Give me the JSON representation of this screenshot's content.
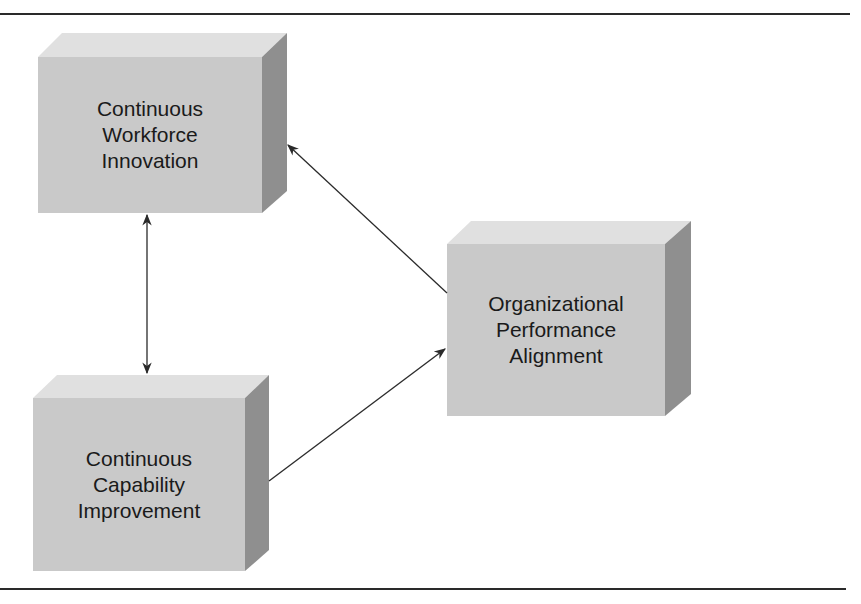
{
  "diagram": {
    "nodes": [
      {
        "id": "workforce-innovation",
        "lines": [
          "Continuous",
          "Workforce",
          "Innovation"
        ]
      },
      {
        "id": "capability-improvement",
        "lines": [
          "Continuous",
          "Capability",
          "Improvement"
        ]
      },
      {
        "id": "performance-alignment",
        "lines": [
          "Organizational",
          "Performance",
          "Alignment"
        ]
      }
    ],
    "edges": [
      {
        "from": "workforce-innovation",
        "to": "capability-improvement",
        "direction": "both"
      },
      {
        "from": "performance-alignment",
        "to": "workforce-innovation",
        "direction": "forward"
      },
      {
        "from": "capability-improvement",
        "to": "performance-alignment",
        "direction": "forward"
      }
    ],
    "colors": {
      "front": "#c9c9c9",
      "top": "#e0e0e0",
      "side": "#8f8f8f",
      "arrow": "#2a2a2a"
    }
  }
}
